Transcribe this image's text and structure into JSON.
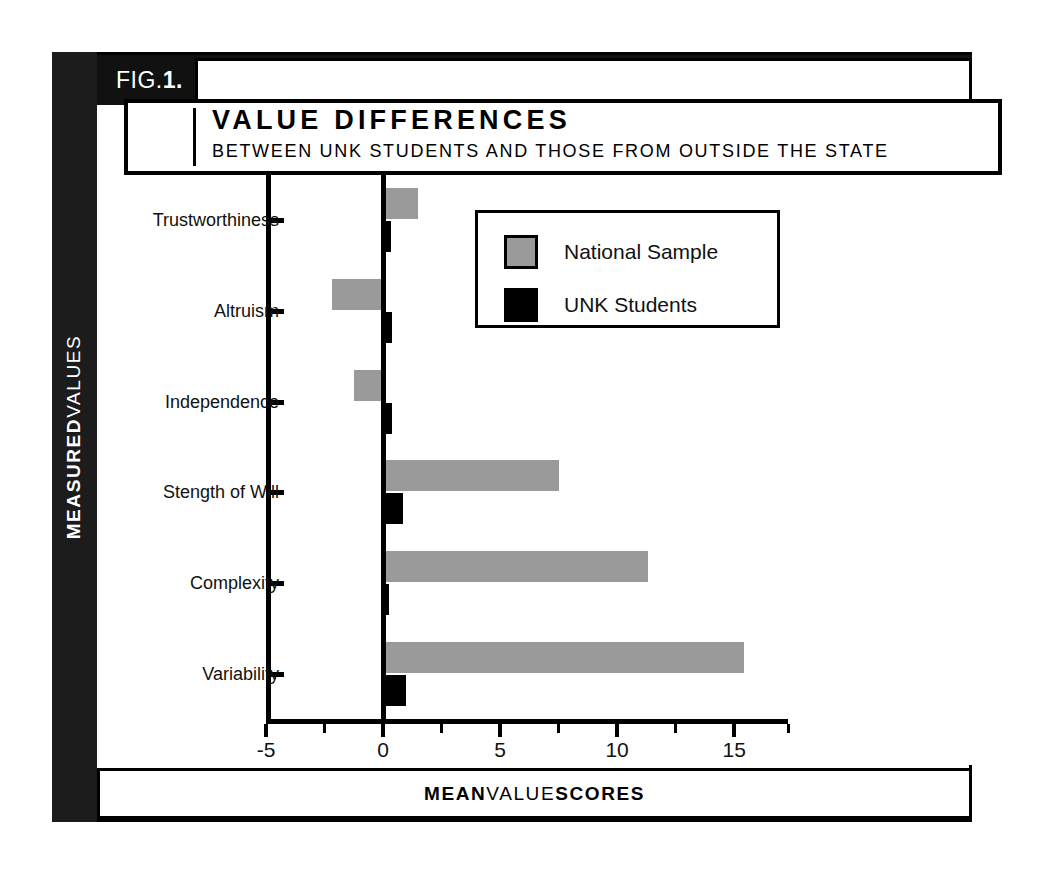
{
  "figure": {
    "fig_label_bold_prefix": "FIG.",
    "fig_label_number": "1",
    "fig_label_suffix": ".",
    "title": "VALUE DIFFERENCES",
    "subtitle": "BETWEEN UNK STUDENTS AND THOSE FROM OUTSIDE THE STATE",
    "y_axis_title_bold": "MEASURED",
    "y_axis_title_light": "VALUES",
    "caption_part1": "MEAN",
    "caption_part2": "VALUE",
    "caption_part3": "SCORES"
  },
  "colors": {
    "national_sample": "#9a9a9a",
    "unk_students": "#000000",
    "frame": "#000000",
    "spine_black": "#1c1c1c",
    "background": "#ffffff"
  },
  "legend": {
    "entries": [
      {
        "label": "National Sample",
        "color": "#9a9a9a",
        "swatch": "national"
      },
      {
        "label": "UNK Students",
        "color": "#000000",
        "swatch": "unk"
      }
    ]
  },
  "chart_data": {
    "type": "bar",
    "orientation": "horizontal",
    "title": "VALUE DIFFERENCES",
    "subtitle": "BETWEEN UNK STUDENTS AND THOSE FROM OUTSIDE THE STATE",
    "xlabel": "MEAN VALUE SCORES",
    "ylabel": "MEASURED VALUES",
    "categories": [
      "Trustworthiness",
      "Altruism",
      "Independence",
      "Stength of Will",
      "Complexity",
      "Variability"
    ],
    "series": [
      {
        "name": "National Sample",
        "color": "#9a9a9a",
        "values": [
          1.5,
          -2.2,
          -1.25,
          7.5,
          11.3,
          15.4
        ]
      },
      {
        "name": "UNK Students",
        "color": "#000000",
        "values": [
          0.35,
          0.4,
          0.4,
          0.85,
          0.25,
          1.0
        ]
      }
    ],
    "xlim": [
      -5,
      17.3
    ],
    "xticks_major": [
      -5,
      0,
      5,
      10,
      15
    ],
    "xtick_labels": [
      "-5",
      "0",
      "5",
      "10",
      "15"
    ],
    "xticks_minor": [
      -2.5,
      2.5,
      7.5,
      12.5,
      17.3
    ],
    "grid": false,
    "legend_position": "upper right",
    "zero_reference_line": true
  }
}
